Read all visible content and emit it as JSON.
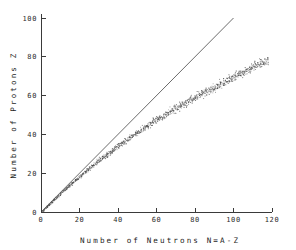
{
  "figure": {
    "background_color": "#ffffff",
    "ink_color": "#3a3a3a"
  },
  "chart_data": {
    "type": "scatter",
    "title": "",
    "subtitle": "",
    "xlabel": "Number of Neutrons  N=A-Z",
    "ylabel": "Number of Protons  Z",
    "xlim": [
      0,
      120
    ],
    "ylim": [
      0,
      100
    ],
    "xticks": [
      0,
      20,
      40,
      60,
      80,
      100,
      120
    ],
    "yticks": [
      0,
      20,
      40,
      60,
      80,
      100
    ],
    "xticklabels": [
      "0",
      "20",
      "40",
      "60",
      "80",
      "100",
      "120"
    ],
    "yticklabels": [
      "0",
      "20",
      "40",
      "60",
      "80",
      "100"
    ],
    "grid": false,
    "legend": false,
    "legend_position": "none",
    "frame": "left-bottom-only",
    "tick_direction": "in",
    "series": [
      {
        "name": "N=Z line",
        "type": "line",
        "color": "#5a5a5a",
        "x": [
          0,
          100
        ],
        "y": [
          0,
          100
        ]
      },
      {
        "name": "Stable nuclides",
        "type": "scatter",
        "color": "#4a4a4a",
        "marker": "point",
        "marker_size": 1,
        "band_description": "Diffuse stippled band of stable nuclides running from the origin and curving progressively below the N=Z line",
        "band_centerline": [
          {
            "n": 0,
            "z": 0
          },
          {
            "n": 10,
            "z": 9.6
          },
          {
            "n": 20,
            "z": 18.6
          },
          {
            "n": 30,
            "z": 26.8
          },
          {
            "n": 40,
            "z": 34.2
          },
          {
            "n": 50,
            "z": 41.2
          },
          {
            "n": 60,
            "z": 47.6
          },
          {
            "n": 70,
            "z": 53.6
          },
          {
            "n": 80,
            "z": 59.2
          },
          {
            "n": 90,
            "z": 64.6
          },
          {
            "n": 100,
            "z": 69.8
          },
          {
            "n": 110,
            "z": 74.8
          },
          {
            "n": 118,
            "z": 78.6
          }
        ],
        "band_halfwidth": [
          {
            "n": 0,
            "w": 0.6
          },
          {
            "n": 20,
            "w": 1.5
          },
          {
            "n": 40,
            "w": 2.3
          },
          {
            "n": 60,
            "w": 2.8
          },
          {
            "n": 80,
            "w": 3.2
          },
          {
            "n": 100,
            "w": 3.4
          },
          {
            "n": 118,
            "w": 3.2
          }
        ],
        "n_range": [
          0,
          118
        ],
        "z_range": [
          0,
          80
        ],
        "point_count": 1150
      }
    ],
    "annotations": []
  }
}
